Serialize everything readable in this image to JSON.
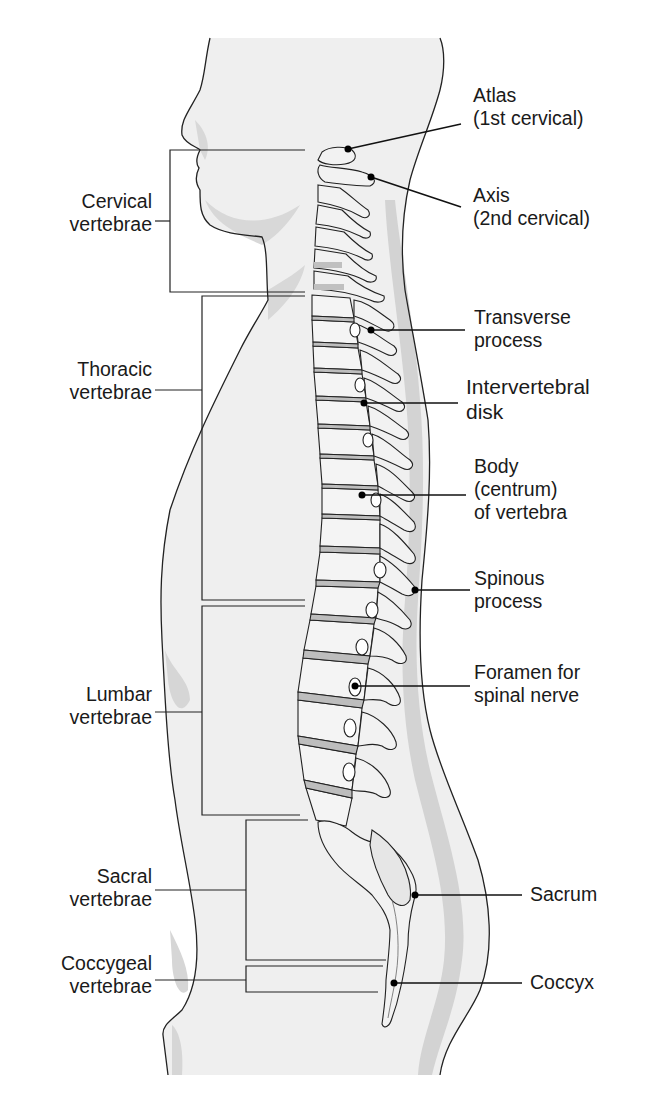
{
  "figure": {
    "colors": {
      "background": "#ffffff",
      "body_fill": "#eeeeee",
      "body_shadow": "#cfcfcf",
      "bone_fill": "#f4f4f4",
      "bone_shadow": "#d6d6d6",
      "disk_fill": "#bdbdbd",
      "line": "#222222"
    }
  },
  "regions": [
    {
      "id": "cervical",
      "line1": "Cervical",
      "line2": "vertebrae"
    },
    {
      "id": "thoracic",
      "line1": "Thoracic",
      "line2": "vertebrae"
    },
    {
      "id": "lumbar",
      "line1": "Lumbar",
      "line2": "vertebrae"
    },
    {
      "id": "sacral",
      "line1": "Sacral",
      "line2": "vertebrae"
    },
    {
      "id": "coccygeal",
      "line1": "Coccygeal",
      "line2": "vertebrae"
    }
  ],
  "structures": [
    {
      "id": "atlas",
      "lines": [
        "Atlas",
        "(1st cervical)"
      ]
    },
    {
      "id": "axis",
      "lines": [
        "Axis",
        "(2nd cervical)"
      ]
    },
    {
      "id": "transverse",
      "lines": [
        "Transverse",
        "process"
      ]
    },
    {
      "id": "intervertebral",
      "lines": [
        "Intervertebral",
        "disk"
      ]
    },
    {
      "id": "body",
      "lines": [
        "Body",
        "(centrum)",
        "of vertebra"
      ]
    },
    {
      "id": "spinous",
      "lines": [
        "Spinous",
        "process"
      ]
    },
    {
      "id": "foramen",
      "lines": [
        "Foramen for",
        "spinal nerve"
      ]
    },
    {
      "id": "sacrum",
      "lines": [
        "Sacrum"
      ]
    },
    {
      "id": "coccyx",
      "lines": [
        "Coccyx"
      ]
    }
  ]
}
